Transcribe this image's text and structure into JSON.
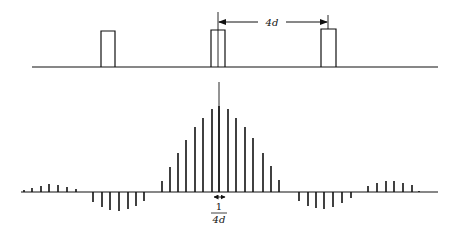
{
  "diagram": {
    "top": {
      "baseline": {
        "y": 67,
        "x1": 32,
        "x2": 438
      },
      "pulses": [
        {
          "x1": 101,
          "x2": 115,
          "top": 31
        },
        {
          "x1": 211,
          "x2": 225,
          "top": 30
        },
        {
          "x1": 321,
          "x2": 336,
          "top": 29
        }
      ],
      "markers": [
        {
          "x": 218,
          "y1": 12,
          "y2": 67
        },
        {
          "x": 328,
          "y1": 15,
          "y2": 29
        }
      ],
      "period_arrow": {
        "x1": 218,
        "x2": 328,
        "y": 22,
        "label": "4d",
        "label_x": 272
      }
    },
    "bottom": {
      "baseline": {
        "y": 192,
        "x1": 21,
        "x2": 438
      },
      "center_line": {
        "x": 219,
        "y1": 82,
        "y2": 192
      },
      "sticks": [
        {
          "x": 24,
          "y": 190
        },
        {
          "x": 32,
          "y": 188
        },
        {
          "x": 41,
          "y": 186
        },
        {
          "x": 49,
          "y": 184
        },
        {
          "x": 58,
          "y": 185
        },
        {
          "x": 67,
          "y": 187
        },
        {
          "x": 76,
          "y": 189
        },
        {
          "x": 93,
          "y": 202
        },
        {
          "x": 102,
          "y": 207
        },
        {
          "x": 110,
          "y": 210
        },
        {
          "x": 119,
          "y": 211
        },
        {
          "x": 128,
          "y": 209
        },
        {
          "x": 136,
          "y": 206
        },
        {
          "x": 144,
          "y": 201
        },
        {
          "x": 162,
          "y": 181
        },
        {
          "x": 170,
          "y": 167
        },
        {
          "x": 178,
          "y": 153
        },
        {
          "x": 186,
          "y": 140
        },
        {
          "x": 195,
          "y": 127
        },
        {
          "x": 203,
          "y": 118
        },
        {
          "x": 212,
          "y": 109
        },
        {
          "x": 219,
          "y": 106
        },
        {
          "x": 228,
          "y": 109
        },
        {
          "x": 236,
          "y": 118
        },
        {
          "x": 245,
          "y": 127
        },
        {
          "x": 253,
          "y": 138
        },
        {
          "x": 263,
          "y": 153
        },
        {
          "x": 271,
          "y": 166
        },
        {
          "x": 279,
          "y": 180
        },
        {
          "x": 299,
          "y": 201
        },
        {
          "x": 308,
          "y": 206
        },
        {
          "x": 316,
          "y": 208
        },
        {
          "x": 324,
          "y": 209
        },
        {
          "x": 333,
          "y": 207
        },
        {
          "x": 342,
          "y": 203
        },
        {
          "x": 351,
          "y": 198
        },
        {
          "x": 368,
          "y": 186
        },
        {
          "x": 377,
          "y": 183
        },
        {
          "x": 386,
          "y": 181
        },
        {
          "x": 394,
          "y": 181
        },
        {
          "x": 403,
          "y": 183
        },
        {
          "x": 412,
          "y": 185
        },
        {
          "x": 419,
          "y": 191
        }
      ],
      "spacing_arrow": {
        "x1": 214,
        "x2": 225,
        "y": 197
      },
      "spacing_label": {
        "numerator": "1",
        "denominator": "4d",
        "x": 219
      }
    }
  }
}
